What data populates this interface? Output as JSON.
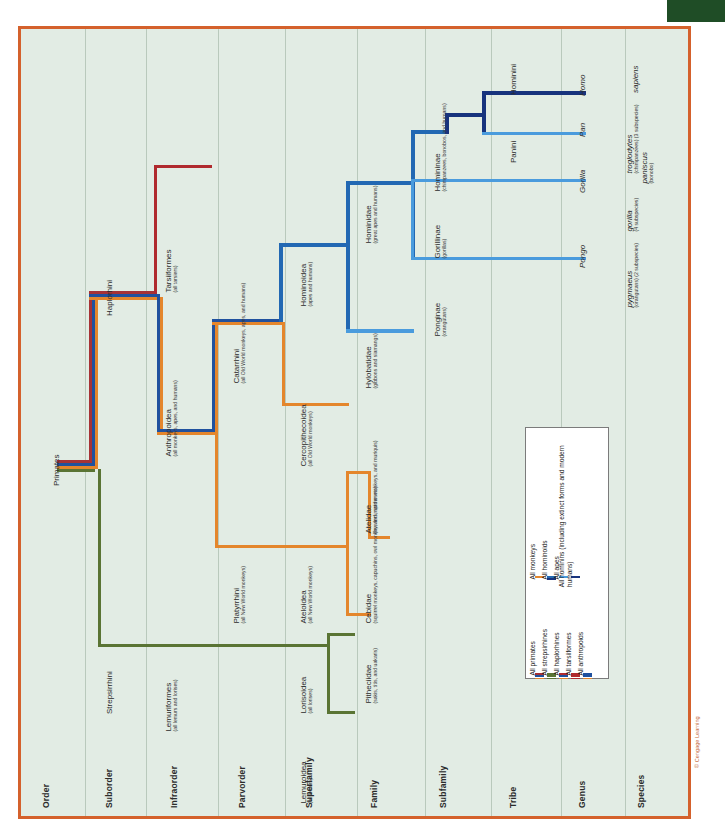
{
  "figure": {
    "credit": "© Cengage Learning",
    "background": "#e2ece4",
    "border_color": "#d4612c"
  },
  "colors": {
    "primates_red": "#a63236",
    "strepsirrhines_green": "#5a7434",
    "haplorhines_darkred": "#b02a2e",
    "tarsiiformes_red": "#b02a2e",
    "anthropoids_navy": "#20519e",
    "monkeys_orange": "#e4862c",
    "hominoids_blue": "#2268b3",
    "apes_lightblue": "#4a9bdd",
    "hominins_darknavy": "#17337d"
  },
  "columns": [
    {
      "label": "Order"
    },
    {
      "label": "Suborder"
    },
    {
      "label": "Infraorder"
    },
    {
      "label": "Parvorder"
    },
    {
      "label": "Superfamily"
    },
    {
      "label": "Family"
    },
    {
      "label": "Subfamily"
    },
    {
      "label": "Tribe"
    },
    {
      "label": "Genus"
    },
    {
      "label": "Species"
    }
  ],
  "taxa": {
    "primates": {
      "name": "Primates",
      "note": ""
    },
    "haplorhini": {
      "name": "Haplorhini",
      "note": ""
    },
    "strepsirrhini": {
      "name": "Strepsirrhini",
      "note": ""
    },
    "tarsiiformes": {
      "name": "Tarsiiformes",
      "note": "(all tarsiers)"
    },
    "anthropoidea": {
      "name": "Anthropoidea",
      "note": "(all monkeys, apes, and humans)"
    },
    "lemuriformes": {
      "name": "Lemuriformes",
      "note": "(all lemurs and lorises)"
    },
    "catarrhini": {
      "name": "Catarrhini",
      "note": "(all Old World monkeys, apes, and humans)"
    },
    "platyrrhini": {
      "name": "Platyrrhini",
      "note": "(all New World monkeys)"
    },
    "hominoidea": {
      "name": "Hominoidea",
      "note": "(apes and humans)"
    },
    "cercopithecoidea": {
      "name": "Cercopithecoidea",
      "note": "(all Old World monkeys)"
    },
    "ateloidea": {
      "name": "Ateloidea",
      "note": "(all New World monkeys)"
    },
    "lorisoidea": {
      "name": "Lorisoidea",
      "note": "(all lorises)"
    },
    "lemuroidea": {
      "name": "Lemuroidea",
      "note": "(all lemurs)"
    },
    "hominidae": {
      "name": "Hominidae",
      "note": "(great apes and humans)"
    },
    "hylobatidae": {
      "name": "Hylobatidae",
      "note": "(gibbons and siamangs)"
    },
    "atelidae": {
      "name": "Atelidae",
      "note": "(howlers, spider monkeys, and muriquis)"
    },
    "cebidae": {
      "name": "Cebidae",
      "note": "(squirrel monkeys, capuchins, owl monkey, and marmosets)"
    },
    "pitheciidae": {
      "name": "Pitheciidae",
      "note": "(sakis, titis, and uakaris)"
    },
    "homininae": {
      "name": "Homininae",
      "note": "(chimpanzees, bonobos, and humans)"
    },
    "gorillinae": {
      "name": "Gorillinae",
      "note": "(gorillas)"
    },
    "ponginae": {
      "name": "Ponginae",
      "note": "(orangutans)"
    },
    "hominini": {
      "name": "Hominini",
      "note": ""
    },
    "panini": {
      "name": "Panini",
      "note": ""
    },
    "homo": {
      "name": "Homo",
      "note": ""
    },
    "pan": {
      "name": "Pan",
      "note": ""
    },
    "gorilla_genus": {
      "name": "Gorilla",
      "note": ""
    },
    "pongo": {
      "name": "Pongo",
      "note": ""
    },
    "sapiens": {
      "name": "sapiens",
      "note": ""
    },
    "troglodytes": {
      "name": "troglodytes",
      "note": "(chimpanzees) (3 subspecies)"
    },
    "paniscus": {
      "name": "paniscus",
      "note": "(bonobo)"
    },
    "gorilla_sp": {
      "name": "gorilla",
      "note": "(4 subspecies)"
    },
    "pygmaeus": {
      "name": "pygmaeus",
      "note": "(orangutans) (2 subspecies)"
    }
  },
  "legend": {
    "group_left": [
      {
        "label": "All primates",
        "colors": [
          "#a63236",
          "#20519e",
          "#e4862c"
        ]
      },
      {
        "label": "All strepsirhines",
        "colors": [
          "#5a7434",
          "#5a7434",
          "#5a7434"
        ]
      },
      {
        "label": "All haplorhines",
        "colors": [
          "#b02a2e",
          "#20519e",
          "#e4862c"
        ]
      },
      {
        "label": "All tarsiiformes",
        "colors": [
          "#b02a2e",
          "#b02a2e",
          "#b02a2e"
        ]
      },
      {
        "label": "All anthropoids",
        "colors": [
          "#20519e",
          "#20519e",
          "#e4862c"
        ]
      }
    ],
    "group_right": [
      {
        "label": "All monkeys",
        "colors": [
          "#e4862c"
        ]
      },
      {
        "label": "All hominoids",
        "colors": [
          "#2268b3",
          "#17337d"
        ]
      },
      {
        "label": "All apes",
        "colors": [
          "#4a9bdd"
        ]
      },
      {
        "label": "All hominins (including extinct forms and modern humans)",
        "colors": [
          "#17337d"
        ]
      }
    ]
  }
}
